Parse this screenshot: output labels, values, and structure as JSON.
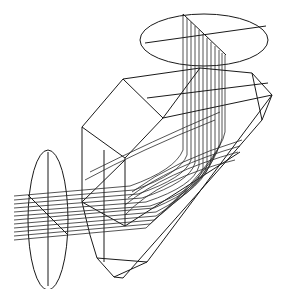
{
  "diagram": {
    "type": "optical-ray-trace",
    "colors": {
      "background": "#ffffff",
      "stroke": "#1a1a1a"
    },
    "components": [
      {
        "id": "input-lens",
        "shape": "ellipse",
        "cx": 48,
        "cy": 220,
        "rx": 20,
        "ry": 70
      },
      {
        "id": "output-lens",
        "shape": "ellipse",
        "cx": 204,
        "cy": 40,
        "rx": 64,
        "ry": 26
      },
      {
        "id": "prism",
        "shape": "polyhedron"
      }
    ],
    "rays": {
      "input_count": 12,
      "output_count": 12
    }
  }
}
